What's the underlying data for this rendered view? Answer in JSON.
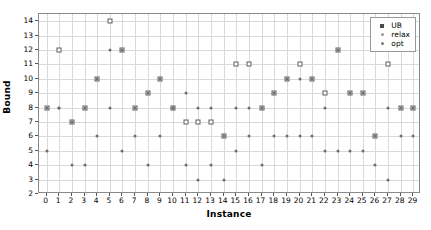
{
  "chart_data": {
    "type": "scatter",
    "title": "",
    "xlabel": "Instance",
    "ylabel": "Bound",
    "xlim": [
      -0.6,
      29.6
    ],
    "ylim": [
      2,
      14.5
    ],
    "grid": true,
    "legend_position": "upper right",
    "xticks": [
      0,
      1,
      2,
      3,
      4,
      5,
      6,
      7,
      8,
      9,
      10,
      11,
      12,
      13,
      14,
      15,
      16,
      17,
      18,
      19,
      20,
      21,
      22,
      23,
      24,
      25,
      26,
      27,
      28,
      29
    ],
    "yticks": [
      2,
      3,
      4,
      5,
      6,
      7,
      8,
      9,
      10,
      11,
      12,
      13,
      14
    ],
    "x": [
      0,
      1,
      2,
      3,
      4,
      5,
      6,
      7,
      8,
      9,
      10,
      11,
      12,
      13,
      14,
      15,
      16,
      17,
      18,
      19,
      20,
      21,
      22,
      23,
      24,
      25,
      26,
      27,
      28,
      29
    ],
    "series": [
      {
        "name": "UB",
        "marker": "square",
        "color": "#5d5d5d",
        "values": [
          8,
          12,
          7,
          8,
          10,
          14,
          12,
          8,
          9,
          10,
          8,
          7,
          7,
          7,
          6,
          11,
          11,
          8,
          9,
          10,
          11,
          10,
          9,
          12,
          9,
          9,
          6,
          11,
          8,
          8
        ]
      },
      {
        "name": "relax",
        "marker": "dot",
        "color": "#6e6e6e",
        "values": [
          8,
          8,
          7,
          8,
          10,
          12,
          12,
          8,
          9,
          10,
          8,
          9,
          8,
          8,
          6,
          8,
          8,
          8,
          9,
          10,
          10,
          10,
          8,
          12,
          9,
          9,
          6,
          8,
          8,
          8
        ]
      },
      {
        "name": "opt",
        "marker": "dot",
        "color": "#6e6e6e",
        "values": [
          5,
          8,
          4,
          4,
          6,
          8,
          5,
          6,
          4,
          6,
          8,
          4,
          3,
          4,
          3,
          5,
          6,
          4,
          6,
          6,
          6,
          6,
          5,
          5,
          5,
          5,
          4,
          3,
          6,
          6
        ]
      }
    ]
  },
  "legend": {
    "entries": [
      {
        "label": "UB"
      },
      {
        "label": "relax"
      },
      {
        "label": "opt"
      }
    ]
  }
}
